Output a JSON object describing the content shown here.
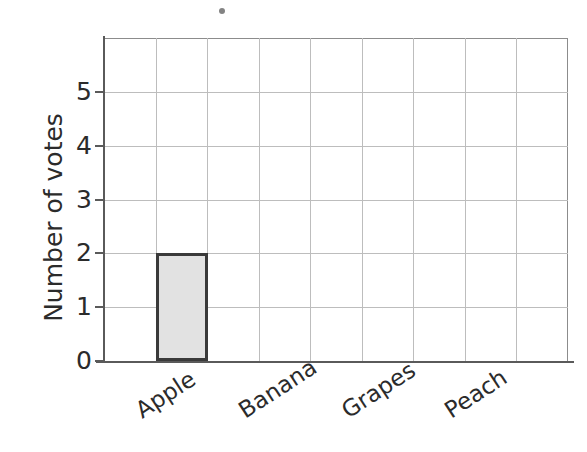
{
  "chart_data": {
    "type": "bar",
    "title": "",
    "xlabel": "",
    "ylabel": "Number of votes",
    "categories": [
      "Apple",
      "Banana",
      "Grapes",
      "Peach"
    ],
    "values": [
      2,
      0,
      0,
      0
    ],
    "ylim": [
      0,
      6
    ],
    "y_ticks": [
      0,
      1,
      2,
      3,
      4,
      5
    ],
    "y_tick_labels": [
      "0",
      "1",
      "2",
      "3",
      "4",
      "5"
    ],
    "grid": true,
    "legend": "none",
    "bar_fill_color": "#e2e2e2",
    "bar_border_color": "#3a3a3a",
    "gridline_color": "#bdbdbd",
    "axis_color": "#5a5a5a",
    "text_color": "#2b2b2b",
    "background_color": "#ffffff"
  },
  "artifact": {
    "name": "scan-speck"
  }
}
